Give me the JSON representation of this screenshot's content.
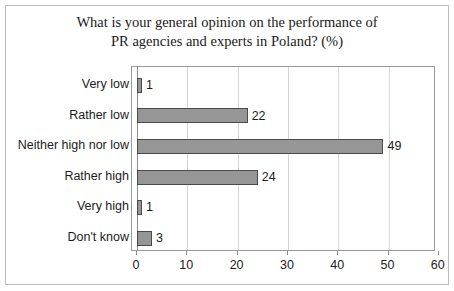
{
  "chart_data": {
    "type": "bar",
    "orientation": "horizontal",
    "title": "What is your general opinion on the performance of PR agencies and experts in Poland? (%)",
    "title_lines": [
      "What is your general opinion on the performance of",
      "PR agencies and experts in Poland? (%)"
    ],
    "categories": [
      "Very low",
      "Rather low",
      "Neither high nor low",
      "Rather high",
      "Very high",
      "Don't know"
    ],
    "values": [
      1,
      22,
      49,
      24,
      1,
      3
    ],
    "value_labels": [
      "1",
      "22",
      "49",
      "24",
      "1",
      "3"
    ],
    "xlabel": "",
    "ylabel": "",
    "xlim": [
      0,
      60
    ],
    "xticks": [
      0,
      10,
      20,
      30,
      40,
      50,
      60
    ],
    "xtick_labels": [
      "0",
      "10",
      "20",
      "30",
      "40",
      "50",
      "60"
    ],
    "grid": "vertical",
    "legend": "none",
    "bar_color": "#969696",
    "bar_border_color": "#4a4a4a",
    "gridline_color": "#d4d4d4",
    "axis_color": "#8c8c8c",
    "text_color": "#1c1c1c",
    "background_color": "#ffffff",
    "border_color": "#bdbdbd"
  }
}
